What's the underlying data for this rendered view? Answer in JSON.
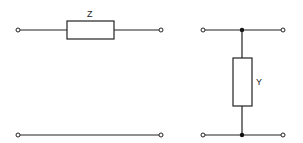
{
  "diagram": {
    "type": "two-port network elements",
    "series_element": {
      "label": "Z",
      "description": "series impedance between input and output terminals; bottom conductor is a straight line"
    },
    "shunt_element": {
      "label": "Y",
      "description": "shunt admittance connected between top and bottom conductors"
    },
    "colors": {
      "line": "#222222",
      "background": "#ffffff"
    }
  }
}
